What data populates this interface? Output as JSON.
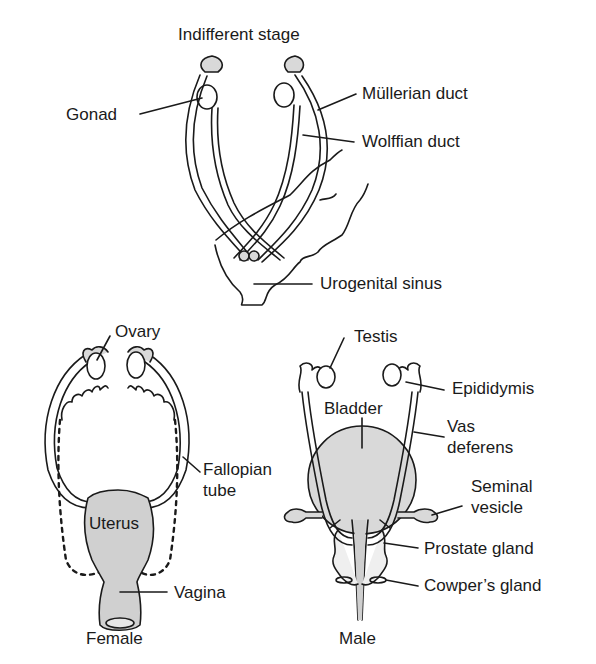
{
  "diagram": {
    "title": "Indifferent stage",
    "indifferent": {
      "labels": {
        "gonad": "Gonad",
        "mullerian_duct": "Müllerian duct",
        "wolffian_duct": "Wolffian duct",
        "urogenital_sinus": "Urogenital sinus"
      }
    },
    "female": {
      "caption": "Female",
      "labels": {
        "ovary": "Ovary",
        "fallopian_tube_line1": "Fallopian",
        "fallopian_tube_line2": "tube",
        "uterus": "Uterus",
        "vagina": "Vagina"
      }
    },
    "male": {
      "caption": "Male",
      "labels": {
        "testis": "Testis",
        "epididymis": "Epididymis",
        "bladder": "Bladder",
        "vas_deferens_line1": "Vas",
        "vas_deferens_line2": "deferens",
        "seminal_vesicle_line1": "Seminal",
        "seminal_vesicle_line2": "vesicle",
        "prostate_gland": "Prostate gland",
        "cowpers_gland": "Cowper’s gland"
      }
    },
    "colors": {
      "line": "#1a1a1a",
      "fill_gray": "#d9d9d9",
      "background": "#ffffff"
    }
  }
}
